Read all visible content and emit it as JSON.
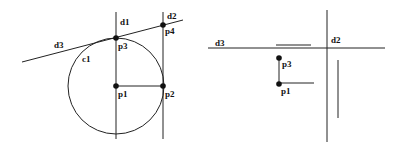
{
  "left_figure": {
    "labels": {
      "d1": "d1",
      "d2": "d2",
      "d3": "d3",
      "c1": "c1",
      "p1": "p1",
      "p2": "p2",
      "p3": "p3",
      "p4": "p4"
    }
  },
  "right_figure": {
    "labels": {
      "d2": "d2",
      "d3": "d3",
      "p1": "p1",
      "p3": "p3"
    }
  },
  "colors": {
    "stroke": "#222222",
    "point": "#111111",
    "background": "#ffffff"
  }
}
